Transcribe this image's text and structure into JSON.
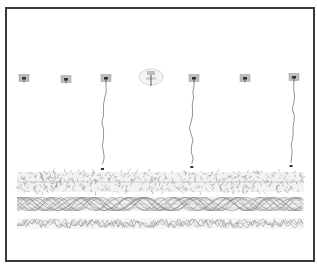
{
  "diagram": {
    "frame": {
      "x": 5,
      "y": 7,
      "width": 308,
      "height": 253,
      "border_color": "#3a3a3a"
    },
    "nodes": [
      {
        "id": "n1",
        "x": 24,
        "y": 78,
        "type": "box"
      },
      {
        "id": "n2",
        "x": 66,
        "y": 79,
        "type": "box"
      },
      {
        "id": "n3",
        "x": 106,
        "y": 78,
        "type": "box"
      },
      {
        "id": "hub",
        "x": 151,
        "y": 77,
        "type": "hub"
      },
      {
        "id": "n4",
        "x": 194,
        "y": 78,
        "type": "box"
      },
      {
        "id": "n5",
        "x": 245,
        "y": 78,
        "type": "box"
      },
      {
        "id": "n6",
        "x": 294,
        "y": 77,
        "type": "box"
      }
    ],
    "tendrils": [
      {
        "from": "n3",
        "to_y": 168
      },
      {
        "from": "n4",
        "to_y": 166
      },
      {
        "from": "n6",
        "to_y": 165
      }
    ],
    "bands": [
      {
        "name": "dense-band",
        "y": 172,
        "height": 20,
        "style": "dense"
      },
      {
        "name": "braided-band",
        "y": 197,
        "height": 14,
        "style": "braided"
      },
      {
        "name": "zigzag-band",
        "y": 218,
        "height": 11,
        "style": "zigzag"
      }
    ],
    "band_x_range": [
      17,
      304
    ],
    "colors": {
      "line": "#666666",
      "node_fill": "#bdbdbd",
      "node_core": "#333333",
      "band": "#8a8a8a"
    }
  }
}
